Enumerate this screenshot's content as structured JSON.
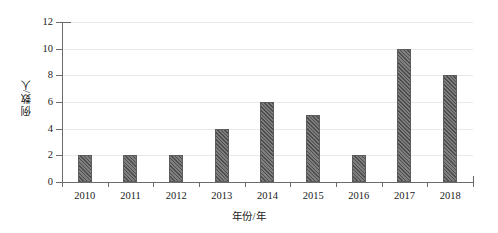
{
  "chart_data": {
    "type": "bar",
    "title": "",
    "subtitle": "",
    "xlabel": "年份/年",
    "ylabel": "例数/人",
    "categories": [
      "2010",
      "2011",
      "2012",
      "2013",
      "2014",
      "2015",
      "2016",
      "2017",
      "2018"
    ],
    "values": [
      2,
      2,
      2,
      4,
      6,
      5,
      2,
      10,
      8
    ],
    "series": [
      {
        "name": "例数",
        "values": [
          2,
          2,
          2,
          4,
          6,
          5,
          2,
          10,
          8
        ]
      }
    ],
    "ylim": [
      0,
      12
    ],
    "y_ticks": [
      0,
      2,
      4,
      6,
      8,
      10,
      12
    ],
    "y_tick_labels": [
      "0",
      "2",
      "4",
      "6",
      "8",
      "10",
      "12"
    ],
    "x_tick_labels": [
      "2010",
      "2011",
      "2012",
      "2013",
      "2014",
      "2015",
      "2016",
      "2017",
      "2018"
    ],
    "grid": true,
    "grid_axis": "y",
    "legend": false,
    "legend_position": "none",
    "bar_fill_color": "#6f6f6f",
    "bar_edge_color": "#5c5c5c",
    "bar_hatch": "diagonal-stripes",
    "gridline_color": "#e9e9e9",
    "axis_color": "#6b6b6b",
    "background_color": "#ffffff",
    "annotations": []
  },
  "axes": {
    "y_title": "例数/人",
    "x_title": "年份/年"
  },
  "y_labels": [
    {
      "text": "12",
      "value": 12
    },
    {
      "text": "10",
      "value": 10
    },
    {
      "text": "8",
      "value": 8
    },
    {
      "text": "6",
      "value": 6
    },
    {
      "text": "4",
      "value": 4
    },
    {
      "text": "2",
      "value": 2
    },
    {
      "text": "0",
      "value": 0
    }
  ],
  "bars": [
    {
      "label": "2010",
      "value": 2
    },
    {
      "label": "2011",
      "value": 2
    },
    {
      "label": "2012",
      "value": 2
    },
    {
      "label": "2013",
      "value": 4
    },
    {
      "label": "2014",
      "value": 6
    },
    {
      "label": "2015",
      "value": 5
    },
    {
      "label": "2016",
      "value": 2
    },
    {
      "label": "2017",
      "value": 10
    },
    {
      "label": "2018",
      "value": 8
    }
  ]
}
